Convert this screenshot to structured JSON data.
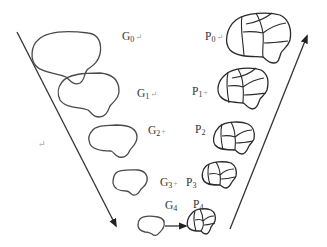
{
  "diagram": {
    "colors": {
      "stroke": "#333333",
      "background": "#ffffff"
    },
    "gaussian_levels": [
      {
        "id": "G0",
        "base": "G",
        "sub": "0",
        "mark": "↵"
      },
      {
        "id": "G1",
        "base": "G",
        "sub": "1",
        "mark": "↵"
      },
      {
        "id": "G2",
        "base": "G",
        "sub": "2",
        "mark": "+"
      },
      {
        "id": "G3",
        "base": "G",
        "sub": "3",
        "mark": "+"
      },
      {
        "id": "G4",
        "base": "G",
        "sub": "4",
        "mark": ""
      }
    ],
    "partition_levels": [
      {
        "id": "P0",
        "base": "P",
        "sub": "0",
        "mark": "↵"
      },
      {
        "id": "P1",
        "base": "P",
        "sub": "1",
        "mark": "+"
      },
      {
        "id": "P2",
        "base": "P",
        "sub": "2",
        "mark": ""
      },
      {
        "id": "P3",
        "base": "P",
        "sub": "3",
        "mark": ""
      },
      {
        "id": "P4",
        "base": "P",
        "sub": "4",
        "mark": ""
      }
    ],
    "left_arrow": {
      "direction": "down",
      "meaning": "downsampling G0 to G4"
    },
    "right_arrow": {
      "direction": "up",
      "meaning": "propagation P4 to P0"
    },
    "transfer_arrow": {
      "from": "G4",
      "to": "P4"
    },
    "stray_mark": "↵"
  }
}
